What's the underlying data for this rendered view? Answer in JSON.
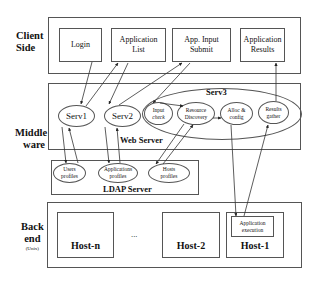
{
  "tiers": {
    "client": {
      "label_line1": "Client",
      "label_line2": "Side"
    },
    "middleware": {
      "label_line1": "Middle",
      "label_line2": "ware"
    },
    "backend": {
      "label_line1": "Back",
      "label_line2": "end",
      "label_sub": "(Unix)"
    }
  },
  "client_boxes": [
    {
      "label": "Login"
    },
    {
      "label_line1": "Application",
      "label_line2": "List"
    },
    {
      "label_line1": "App. Input",
      "label_line2": "Submit"
    },
    {
      "label_line1": "Application",
      "label_line2": "Results"
    }
  ],
  "middleware": {
    "web_server_label": "Web Server",
    "serv1": "Serv1",
    "serv2": "Serv2",
    "serv3": {
      "label": "Serv3",
      "modules": [
        {
          "line1": "Input",
          "line2": "check"
        },
        {
          "line1": "Resource",
          "line2": "Discovery"
        },
        {
          "line1": "Alloc &",
          "line2": "config"
        },
        {
          "line1": "Results",
          "line2": "gather"
        }
      ]
    }
  },
  "ldap": {
    "label": "LDAP Server",
    "profiles": [
      {
        "line1": "Users",
        "line2": "profiles"
      },
      {
        "line1": "Applications",
        "line2": "profiles"
      },
      {
        "line1": "Hosts",
        "line2": "profiles"
      }
    ]
  },
  "backend": {
    "hosts": [
      {
        "label": "Host-n"
      },
      {
        "label": "Host-2"
      },
      {
        "label": "Host-1"
      }
    ],
    "ellipsis": "...",
    "app_execution": {
      "line1": "Application",
      "line2": "execution"
    }
  },
  "colors": {
    "line": "#333333",
    "border": "#555555",
    "background": "#ffffff"
  }
}
